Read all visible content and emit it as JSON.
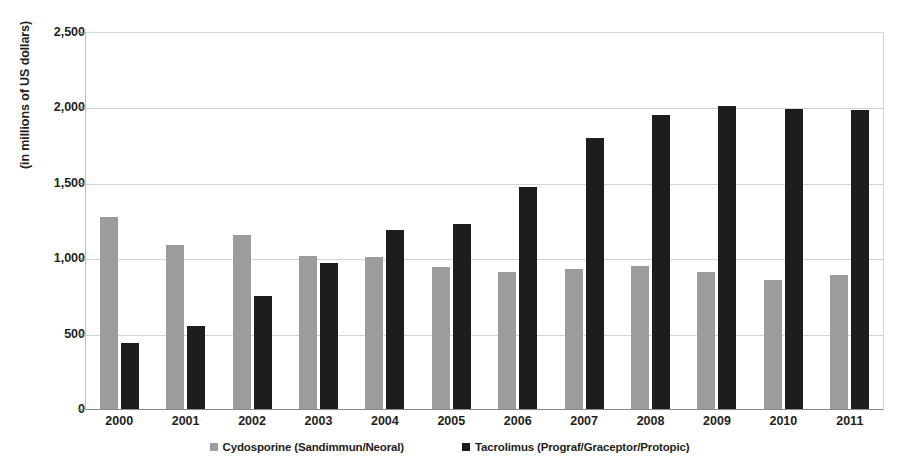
{
  "chart_data": {
    "type": "bar",
    "title": "",
    "subtitle": "",
    "xlabel": "",
    "ylabel": "(in millions of US dollars)",
    "ylim": [
      0,
      2500
    ],
    "ytick_step": 500,
    "ytick_labels": [
      "2,500",
      "2,000",
      "1,500",
      "1,000",
      "500",
      "0"
    ],
    "ytick_values": [
      2500,
      2000,
      1500,
      1000,
      500,
      0
    ],
    "grid": true,
    "legend_position": "bottom",
    "categories": [
      "2000",
      "2001",
      "2002",
      "2003",
      "2004",
      "2005",
      "2006",
      "2007",
      "2008",
      "2009",
      "2010",
      "2011"
    ],
    "series": [
      {
        "name": "Cydosporine (Sandimmun/Neoral)",
        "color": "#9c9c9c",
        "values": [
          1270,
          1085,
          1155,
          1015,
          1005,
          945,
          910,
          930,
          950,
          910,
          855,
          890
        ]
      },
      {
        "name": "Tacrolimus (Prograf/Graceptor/Protopic)",
        "color": "#1d1d1d",
        "values": [
          440,
          550,
          750,
          965,
          1190,
          1225,
          1470,
          1800,
          1950,
          2010,
          1990,
          1985
        ]
      }
    ]
  },
  "legend": {
    "items": [
      {
        "label": "Cydosporine (Sandimmun/Neoral)",
        "color": "#9c9c9c"
      },
      {
        "label": "Tacrolimus (Prograf/Graceptor/Protopic)",
        "color": "#1d1d1d"
      }
    ]
  },
  "axis": {
    "y_title": "(in millions of US dollars)"
  }
}
